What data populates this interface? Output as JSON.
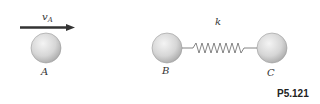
{
  "figure": {
    "id": "P5.121",
    "velocity_label": "v",
    "velocity_subscript": "A",
    "spring_label": "k",
    "balls": [
      {
        "label": "A"
      },
      {
        "label": "B"
      },
      {
        "label": "C"
      }
    ]
  },
  "colors": {
    "ball_fill": "#d4d4d4",
    "ball_edge": "#9a9a9a",
    "arrow": "#333333",
    "spring": "#666666"
  }
}
